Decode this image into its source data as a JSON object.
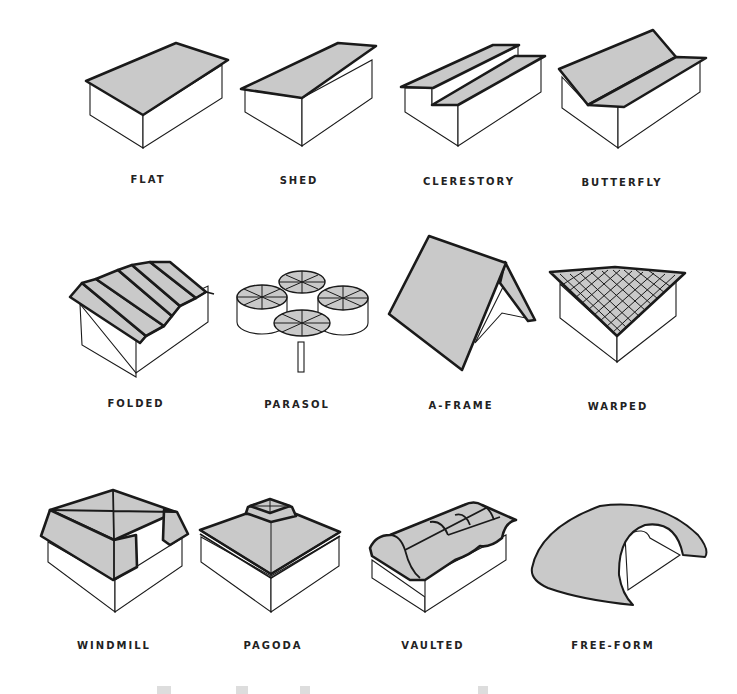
{
  "figure": {
    "rows": [
      {
        "items": [
          {
            "label": "FLAT"
          },
          {
            "label": "SHED"
          },
          {
            "label": "CLERESTORY"
          },
          {
            "label": "BUTTERFLY"
          }
        ]
      },
      {
        "items": [
          {
            "label": "FOLDED"
          },
          {
            "label": "PARASOL"
          },
          {
            "label": "A-FRAME"
          },
          {
            "label": "WARPED"
          }
        ]
      },
      {
        "items": [
          {
            "label": "WINDMILL"
          },
          {
            "label": "PAGODA"
          },
          {
            "label": "VAULTED"
          },
          {
            "label": "FREE-FORM"
          }
        ]
      }
    ],
    "colors": {
      "roof_fill": "#c9c9c9",
      "line": "#1a1a1a",
      "background": "#ffffff"
    }
  }
}
